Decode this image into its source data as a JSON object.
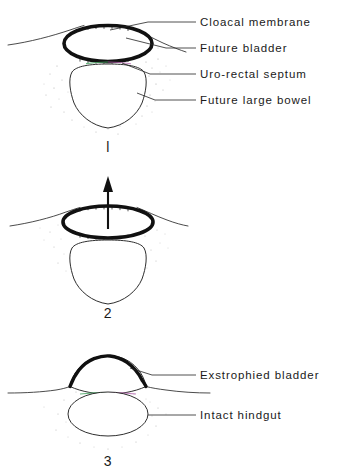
{
  "figure": {
    "panel_count": 3
  },
  "panels": [
    {
      "id": "panel-1",
      "number": "l",
      "labels": [
        {
          "key": "cloacal_membrane",
          "text": "Cloacal membrane"
        },
        {
          "key": "future_bladder",
          "text": "Future bladder"
        },
        {
          "key": "uro_rectal_septum",
          "text": "Uro-rectal septum"
        },
        {
          "key": "future_large_bowel",
          "text": "Future large bowel"
        }
      ]
    },
    {
      "id": "panel-2",
      "number": "2",
      "labels": [],
      "annotation": {
        "key": "rupture_arrow",
        "name": "upward-arrow",
        "direction": "up"
      }
    },
    {
      "id": "panel-3",
      "number": "3",
      "labels": [
        {
          "key": "exstrophied_bladder",
          "text": "Exstrophied bladder"
        },
        {
          "key": "intact_hindgut",
          "text": "Intact hindgut"
        }
      ]
    }
  ],
  "colors": {
    "ink": "#1a1a1a",
    "line": "#232323",
    "membrane": "#111111",
    "background": "#ffffff",
    "stipple": "#6d6d6d",
    "tint_green": "#4fa86a",
    "tint_magenta": "#b667b0"
  }
}
